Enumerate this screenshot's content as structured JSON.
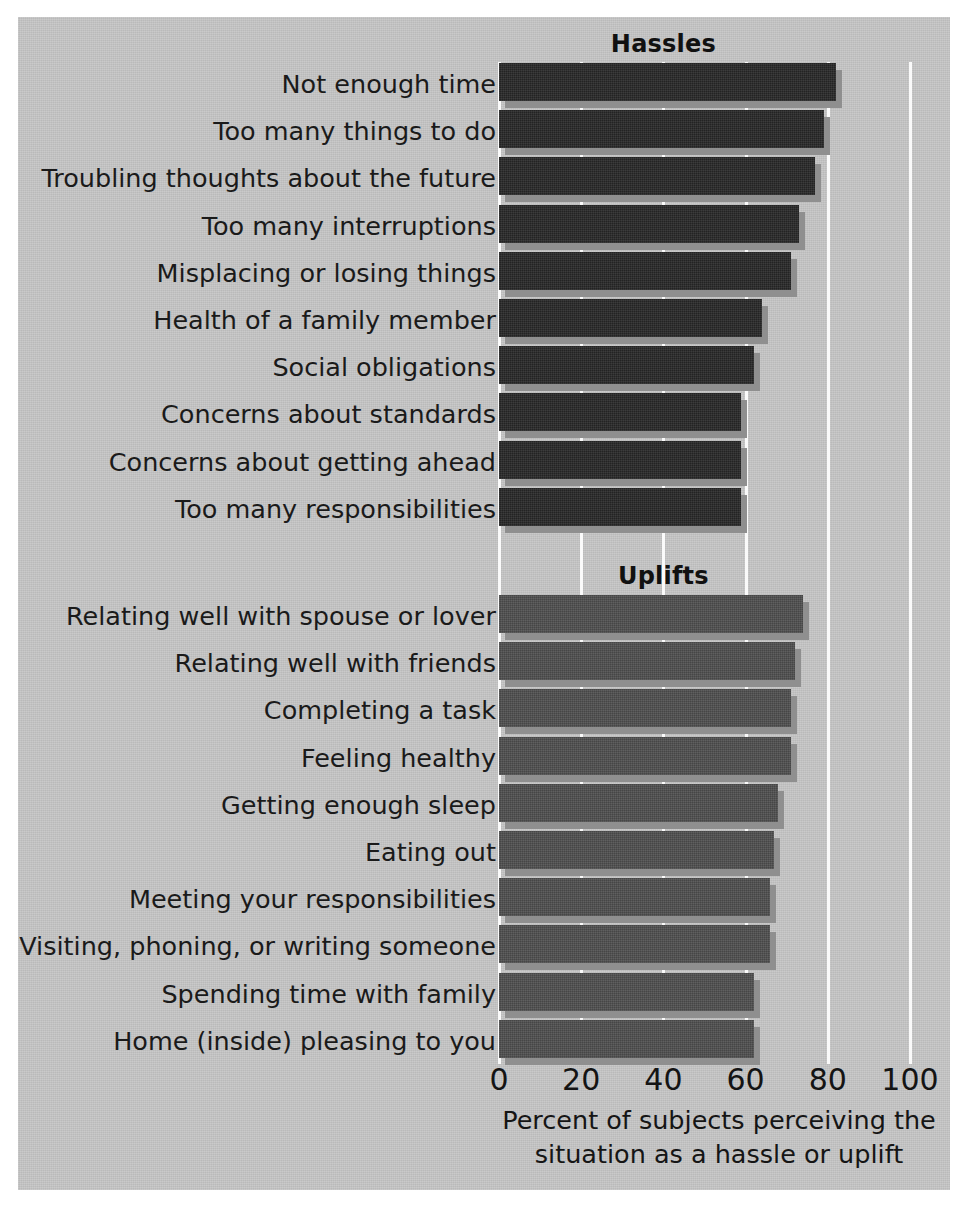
{
  "figure": {
    "background_color": "#c6c6c6",
    "hassle_bar_color": "#272727",
    "uplift_bar_color": "#4e4e4e",
    "gridline_color": "#fafafa"
  },
  "axis": {
    "caption_line1": "Percent of subjects perceiving the",
    "caption_line2": "situation as a hassle or uplift",
    "ticks": [
      "0",
      "20",
      "40",
      "60",
      "80",
      "100"
    ],
    "tick_values": [
      0,
      20,
      40,
      60,
      80,
      100
    ]
  },
  "sections": [
    {
      "title": "Hassles"
    },
    {
      "title": "Uplifts"
    }
  ],
  "chart_data": {
    "type": "bar",
    "orientation": "horizontal",
    "title": "",
    "xlabel": "Percent of subjects perceiving the situation as a hassle or uplift",
    "ylabel": "",
    "xlim": [
      0,
      100
    ],
    "xticks": [
      0,
      20,
      40,
      60,
      80,
      100
    ],
    "grid": true,
    "legend": "none",
    "groups": [
      {
        "name": "Hassles",
        "color": "#272727",
        "categories": [
          "Not enough time",
          "Too many things to do",
          "Troubling thoughts about the future",
          "Too many interruptions",
          "Misplacing or losing things",
          "Health of a family member",
          "Social obligations",
          "Concerns about standards",
          "Concerns about getting ahead",
          "Too many responsibilities"
        ],
        "values": [
          82,
          79,
          77,
          73,
          71,
          64,
          62,
          59,
          59,
          59
        ]
      },
      {
        "name": "Uplifts",
        "color": "#4e4e4e",
        "categories": [
          "Relating well with spouse or lover",
          "Relating well with friends",
          "Completing a task",
          "Feeling healthy",
          "Getting enough sleep",
          "Eating out",
          "Meeting your responsibilities",
          "Visiting, phoning, or writing someone",
          "Spending time with family",
          "Home (inside) pleasing to you"
        ],
        "values": [
          74,
          72,
          71,
          71,
          68,
          67,
          66,
          66,
          62,
          62
        ]
      }
    ]
  }
}
